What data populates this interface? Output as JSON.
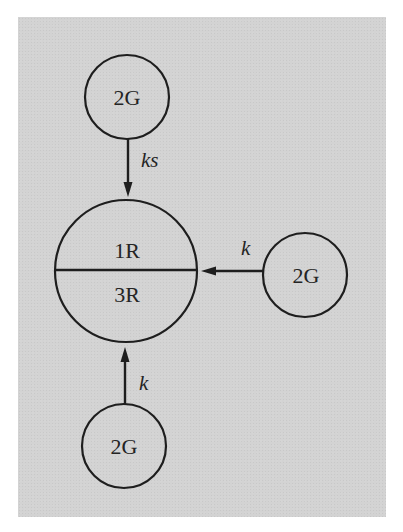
{
  "diagram": {
    "colors": {
      "background": "#d3d3d3",
      "stroke": "#1e1e1e",
      "text": "#242424"
    },
    "central_node": {
      "top_label": "1R",
      "bottom_label": "3R"
    },
    "nodes": {
      "top": {
        "label": "2G"
      },
      "right": {
        "label": "2G"
      },
      "bottom": {
        "label": "2G"
      }
    },
    "edges": {
      "top_to_center": {
        "label": "ks",
        "from": "top",
        "to": "central"
      },
      "right_to_center": {
        "label": "k",
        "from": "right",
        "to": "central"
      },
      "bottom_to_center": {
        "label": "k",
        "from": "bottom",
        "to": "central"
      }
    }
  }
}
